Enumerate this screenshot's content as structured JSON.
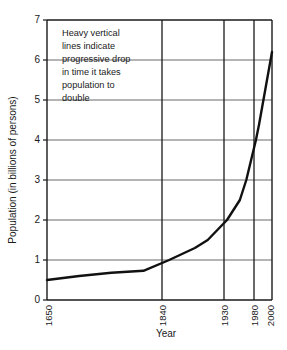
{
  "chart_data": {
    "type": "line",
    "title": "",
    "xlabel": "Year",
    "ylabel": "Population (in billions of persons)",
    "xlim": [
      1650,
      2000
    ],
    "ylim": [
      0,
      7
    ],
    "grid": true,
    "legend_position": "none",
    "x_ticks": [
      {
        "value": 1650,
        "label": "1650"
      },
      {
        "value": 1840,
        "label": "1840"
      },
      {
        "value": 1930,
        "label": "1930"
      },
      {
        "value": 1980,
        "label": "1980"
      },
      {
        "value": 2000,
        "label": "2000"
      }
    ],
    "y_ticks": [
      {
        "value": 0,
        "label": "0"
      },
      {
        "value": 1,
        "label": "1"
      },
      {
        "value": 2,
        "label": "2"
      },
      {
        "value": 3,
        "label": "3"
      },
      {
        "value": 4,
        "label": "4"
      },
      {
        "value": 5,
        "label": "5"
      },
      {
        "value": 6,
        "label": "6"
      },
      {
        "value": 7,
        "label": "7"
      }
    ],
    "series": [
      {
        "name": "World population",
        "x": [
          1650,
          1700,
          1750,
          1800,
          1840,
          1880,
          1900,
          1930,
          1950,
          1960,
          1975,
          1980,
          1990,
          2000
        ],
        "values": [
          0.5,
          0.6,
          0.68,
          0.73,
          1.0,
          1.3,
          1.5,
          2.0,
          2.5,
          3.0,
          4.0,
          4.4,
          5.3,
          6.2
        ]
      }
    ],
    "annotations": [
      {
        "name": "doubling-time-note",
        "lines": [
          "Heavy vertical",
          "lines indicate",
          "progressive drop",
          "in time it takes",
          "population to",
          "double"
        ]
      }
    ],
    "colors": {
      "curve": "#111111",
      "grid_horizontal": "#5a5a5a",
      "grid_vertical": "#1a1a1a",
      "axis": "#1a1a1a",
      "background": "#ffffff"
    }
  }
}
